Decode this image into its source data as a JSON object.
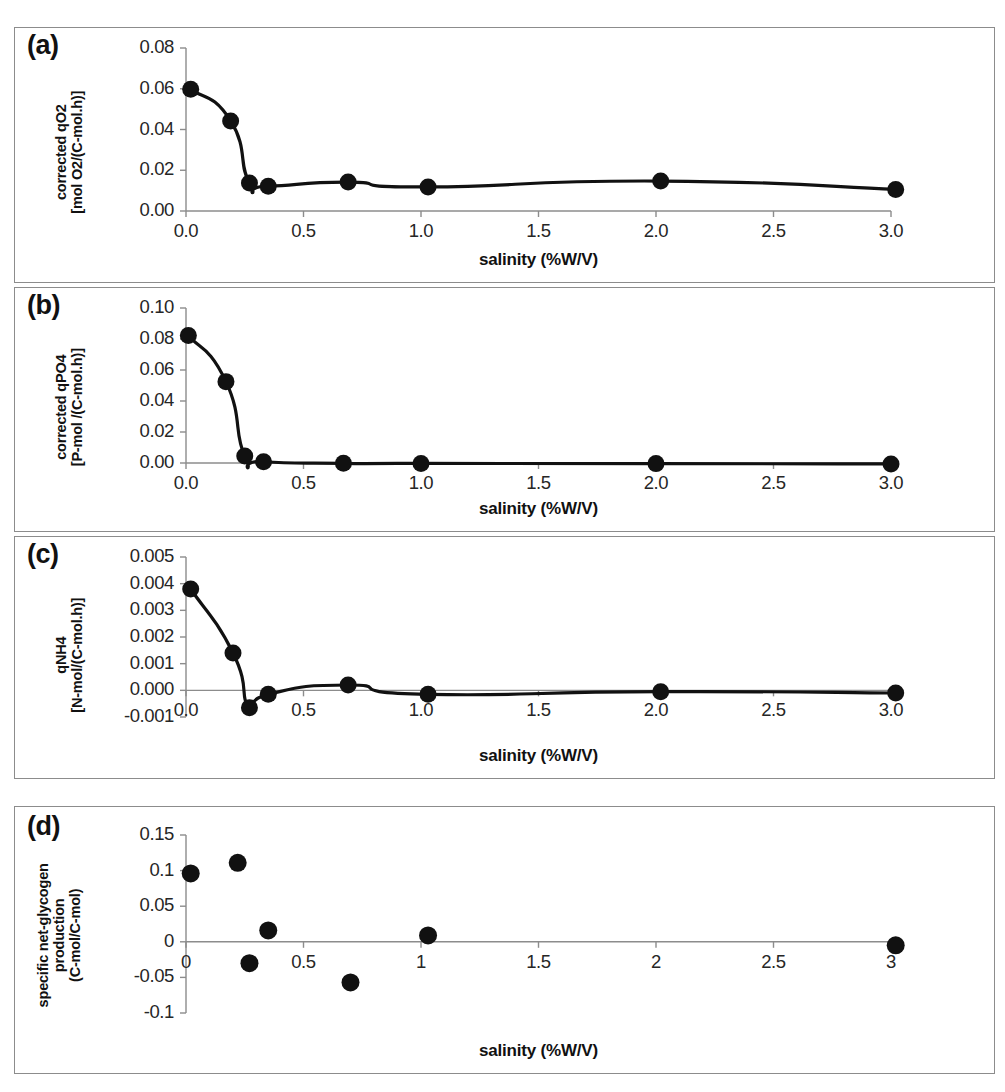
{
  "figure": {
    "background": "#ffffff",
    "marker_color": "#111111",
    "line_color": "#111111",
    "axis_color": "#8c8c8c",
    "frame_color": "#8c8c8c",
    "panel_count": 4
  },
  "chart_data": [
    {
      "panel": "(a)",
      "type": "scatter",
      "title": "",
      "xlabel": "salinity (%W/V)",
      "ylabel": "corrected qO2 [mol O2/(C-mol.h)]",
      "ylabel_lines": [
        "corrected qO2",
        "[mol O2/(C-mol.h)]"
      ],
      "xlim": [
        0.0,
        3.0
      ],
      "ylim": [
        0.0,
        0.08
      ],
      "xticks": [
        0.0,
        0.5,
        1.0,
        1.5,
        2.0,
        2.5,
        3.0
      ],
      "xticklabels": [
        "0.0",
        "0.5",
        "1.0",
        "1.5",
        "2.0",
        "2.5",
        "3.0"
      ],
      "yticks": [
        0.0,
        0.02,
        0.04,
        0.06,
        0.08
      ],
      "yticklabels": [
        "0.00",
        "0.02",
        "0.04",
        "0.06",
        "0.08"
      ],
      "grid": false,
      "legend": null,
      "has_fit_curve": true,
      "x": [
        0.02,
        0.19,
        0.27,
        0.35,
        0.69,
        1.03,
        2.02,
        3.02
      ],
      "y": [
        0.0598,
        0.0442,
        0.0137,
        0.0122,
        0.0142,
        0.0118,
        0.0147,
        0.0106
      ]
    },
    {
      "panel": "(b)",
      "type": "scatter",
      "title": "",
      "xlabel": "salinity (%W/V)",
      "ylabel": "corrected qPO4 [P-mol /(C-mol.h)]",
      "ylabel_lines": [
        "corrected qPO4",
        "[P-mol /(C-mol.h)]"
      ],
      "xlim": [
        0.0,
        3.0
      ],
      "ylim": [
        0.0,
        0.1
      ],
      "xticks": [
        0.0,
        0.5,
        1.0,
        1.5,
        2.0,
        2.5,
        3.0
      ],
      "xticklabels": [
        "0.0",
        "0.5",
        "1.0",
        "1.5",
        "2.0",
        "2.5",
        "3.0"
      ],
      "yticks": [
        0.0,
        0.02,
        0.04,
        0.06,
        0.08,
        0.1
      ],
      "yticklabels": [
        "0.00",
        "0.02",
        "0.04",
        "0.06",
        "0.08",
        "0.10"
      ],
      "grid": false,
      "legend": null,
      "has_fit_curve": true,
      "x": [
        0.01,
        0.17,
        0.25,
        0.33,
        0.67,
        1.0,
        2.0,
        3.0
      ],
      "y": [
        0.0822,
        0.0525,
        0.0045,
        0.0008,
        -0.0002,
        -0.0003,
        -0.0004,
        -0.0006
      ]
    },
    {
      "panel": "(c)",
      "type": "scatter",
      "title": "",
      "xlabel": "salinity (%W/V)",
      "ylabel": "qNH4 [N-mol/(C-mol.h)]",
      "ylabel_lines": [
        "qNH4",
        "[N-mol/(C-mol.h)]"
      ],
      "xlim": [
        0.0,
        3.0
      ],
      "ylim": [
        -0.001,
        0.005
      ],
      "xticks": [
        0.0,
        0.5,
        1.0,
        1.5,
        2.0,
        2.5,
        3.0
      ],
      "xticklabels": [
        "0.0",
        "0.5",
        "1.0",
        "1.5",
        "2.0",
        "2.5",
        "3.0"
      ],
      "yticks": [
        -0.001,
        0.0,
        0.001,
        0.002,
        0.003,
        0.004,
        0.005
      ],
      "yticklabels": [
        "-0.001",
        "0.000",
        "0.001",
        "0.002",
        "0.003",
        "0.004",
        "0.005"
      ],
      "grid": false,
      "legend": null,
      "has_fit_curve": true,
      "x": [
        0.02,
        0.2,
        0.27,
        0.35,
        0.69,
        1.03,
        2.02,
        3.02
      ],
      "y": [
        0.0038,
        0.0014,
        -0.00065,
        -0.00015,
        0.0002,
        -0.00015,
        -5e-05,
        -0.0001
      ]
    },
    {
      "panel": "(d)",
      "type": "scatter",
      "title": "",
      "xlabel": "salinity (%W/V)",
      "ylabel": "specific net-glycogen production (C-mol/C-mol)",
      "ylabel_lines": [
        "specific net-glycogen",
        "production",
        "(C-mol/C-mol)"
      ],
      "xlim": [
        0.0,
        3.0
      ],
      "ylim": [
        -0.1,
        0.15
      ],
      "xticks": [
        0.0,
        0.5,
        1.0,
        1.5,
        2.0,
        2.5,
        3.0
      ],
      "xticklabels": [
        "0",
        "0.5",
        "1",
        "1.5",
        "2",
        "2.5",
        "3"
      ],
      "yticks": [
        -0.1,
        -0.05,
        0.0,
        0.05,
        0.1,
        0.15
      ],
      "yticklabels": [
        "-0.1",
        "-0.05",
        "0",
        "0.05",
        "0.1",
        "0.15"
      ],
      "grid": false,
      "legend": null,
      "has_fit_curve": false,
      "x": [
        0.02,
        0.22,
        0.27,
        0.35,
        0.7,
        1.03,
        3.02
      ],
      "y": [
        0.096,
        0.111,
        -0.03,
        0.016,
        -0.057,
        0.009,
        -0.005
      ]
    }
  ]
}
